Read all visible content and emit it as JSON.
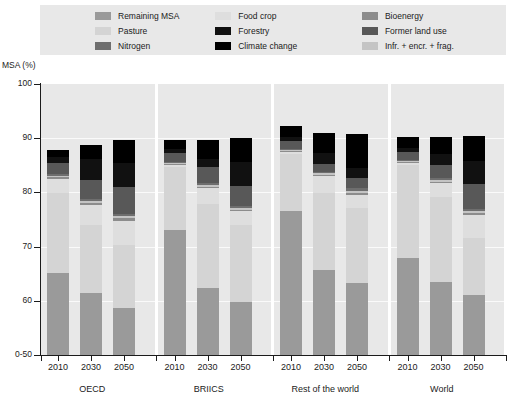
{
  "axis_title": "MSA (%)",
  "legend": {
    "columns": [
      [
        {
          "label": "Remaining MSA",
          "color": "#9a9a9a"
        },
        {
          "label": "Pasture",
          "color": "#d4d4d4"
        },
        {
          "label": "Nitrogen",
          "color": "#6e6e6e"
        }
      ],
      [
        {
          "label": "Food crop",
          "color": "#dedede"
        },
        {
          "label": "Forestry",
          "color": "#111111"
        },
        {
          "label": "Climate change",
          "color": "#000000"
        }
      ],
      [
        {
          "label": "Bioenergy",
          "color": "#8c8c8c"
        },
        {
          "label": "Former land use",
          "color": "#585858"
        },
        {
          "label": "Infr. + encr. + frag.",
          "color": "#c4c4c4"
        }
      ]
    ]
  },
  "chart_data": {
    "type": "bar",
    "subtype": "stacked",
    "title": "",
    "xlabel": "",
    "ylabel": "MSA (%)",
    "ylim": [
      50,
      100
    ],
    "ytick_labels": [
      "0-50",
      "60",
      "70",
      "80",
      "90",
      "100"
    ],
    "ytick_values": [
      50,
      60,
      70,
      80,
      90,
      100
    ],
    "grid": true,
    "legend_position": "top",
    "groups": [
      {
        "name": "OECD",
        "categories": [
          "2010",
          "2030",
          "2050"
        ]
      },
      {
        "name": "BRIICS",
        "categories": [
          "2010",
          "2030",
          "2050"
        ]
      },
      {
        "name": "Rest of the world",
        "categories": [
          "2010",
          "2030",
          "2050"
        ]
      },
      {
        "name": "World",
        "categories": [
          "2010",
          "2030",
          "2050"
        ]
      }
    ],
    "stack_order_bottom_to_top": [
      "Remaining MSA",
      "Pasture",
      "Food crop",
      "Bioenergy",
      "Infr. + encr. + frag.",
      "Nitrogen",
      "Former land use",
      "Forestry",
      "Climate change"
    ],
    "series_colors": {
      "Remaining MSA": "#9a9a9a",
      "Pasture": "#d4d4d4",
      "Food crop": "#dedede",
      "Bioenergy": "#8c8c8c",
      "Infr. + encr. + frag.": "#c4c4c4",
      "Nitrogen": "#6e6e6e",
      "Former land use": "#585858",
      "Forestry": "#111111",
      "Climate change": "#000000"
    },
    "bars": [
      {
        "group": "OECD",
        "year": "2010",
        "total_top": 87.8,
        "segments": [
          {
            "name": "Remaining MSA",
            "from": 50.0,
            "to": 65.2
          },
          {
            "name": "Pasture",
            "from": 65.2,
            "to": 79.8
          },
          {
            "name": "Food crop",
            "from": 79.8,
            "to": 82.5
          },
          {
            "name": "Bioenergy",
            "from": 82.5,
            "to": 82.8
          },
          {
            "name": "Infr. + encr. + frag.",
            "from": 82.8,
            "to": 83.0
          },
          {
            "name": "Nitrogen",
            "from": 83.0,
            "to": 83.3
          },
          {
            "name": "Former land use",
            "from": 83.3,
            "to": 85.5
          },
          {
            "name": "Forestry",
            "from": 85.5,
            "to": 86.6
          },
          {
            "name": "Climate change",
            "from": 86.6,
            "to": 87.8
          }
        ]
      },
      {
        "group": "OECD",
        "year": "2030",
        "total_top": 88.8,
        "segments": [
          {
            "name": "Remaining MSA",
            "from": 50.0,
            "to": 61.4
          },
          {
            "name": "Pasture",
            "from": 61.4,
            "to": 74.0
          },
          {
            "name": "Food crop",
            "from": 74.0,
            "to": 77.7
          },
          {
            "name": "Bioenergy",
            "from": 77.7,
            "to": 78.0
          },
          {
            "name": "Infr. + encr. + frag.",
            "from": 78.0,
            "to": 78.4
          },
          {
            "name": "Nitrogen",
            "from": 78.4,
            "to": 78.7
          },
          {
            "name": "Former land use",
            "from": 78.7,
            "to": 82.3
          },
          {
            "name": "Forestry",
            "from": 82.3,
            "to": 86.2
          },
          {
            "name": "Climate change",
            "from": 86.2,
            "to": 88.8
          }
        ]
      },
      {
        "group": "OECD",
        "year": "2050",
        "total_top": 89.6,
        "segments": [
          {
            "name": "Remaining MSA",
            "from": 50.0,
            "to": 58.7
          },
          {
            "name": "Pasture",
            "from": 58.7,
            "to": 70.3
          },
          {
            "name": "Food crop",
            "from": 70.3,
            "to": 74.8
          },
          {
            "name": "Bioenergy",
            "from": 74.8,
            "to": 75.2
          },
          {
            "name": "Infr. + encr. + frag.",
            "from": 75.2,
            "to": 75.6
          },
          {
            "name": "Nitrogen",
            "from": 75.6,
            "to": 76.0
          },
          {
            "name": "Former land use",
            "from": 76.0,
            "to": 81.0
          },
          {
            "name": "Forestry",
            "from": 81.0,
            "to": 85.5
          },
          {
            "name": "Climate change",
            "from": 85.5,
            "to": 89.6
          }
        ]
      },
      {
        "group": "BRIICS",
        "year": "2010",
        "total_top": 89.7,
        "segments": [
          {
            "name": "Remaining MSA",
            "from": 50.0,
            "to": 73.1
          },
          {
            "name": "Pasture",
            "from": 73.1,
            "to": 84.6
          },
          {
            "name": "Food crop",
            "from": 84.6,
            "to": 85.0
          },
          {
            "name": "Bioenergy",
            "from": 85.0,
            "to": 85.2
          },
          {
            "name": "Infr. + encr. + frag.",
            "from": 85.2,
            "to": 85.4
          },
          {
            "name": "Nitrogen",
            "from": 85.4,
            "to": 85.6
          },
          {
            "name": "Former land use",
            "from": 85.6,
            "to": 87.2
          },
          {
            "name": "Forestry",
            "from": 87.2,
            "to": 88.0
          },
          {
            "name": "Climate change",
            "from": 88.0,
            "to": 89.7
          }
        ]
      },
      {
        "group": "BRIICS",
        "year": "2030",
        "total_top": 89.6,
        "segments": [
          {
            "name": "Remaining MSA",
            "from": 50.0,
            "to": 62.3
          },
          {
            "name": "Pasture",
            "from": 62.3,
            "to": 77.8
          },
          {
            "name": "Food crop",
            "from": 77.8,
            "to": 80.8
          },
          {
            "name": "Bioenergy",
            "from": 80.8,
            "to": 81.0
          },
          {
            "name": "Infr. + encr. + frag.",
            "from": 81.0,
            "to": 81.4
          },
          {
            "name": "Nitrogen",
            "from": 81.4,
            "to": 81.7
          },
          {
            "name": "Former land use",
            "from": 81.7,
            "to": 84.6
          },
          {
            "name": "Forestry",
            "from": 84.6,
            "to": 86.2
          },
          {
            "name": "Climate change",
            "from": 86.2,
            "to": 89.6
          }
        ]
      },
      {
        "group": "BRIICS",
        "year": "2050",
        "total_top": 90.1,
        "segments": [
          {
            "name": "Remaining MSA",
            "from": 50.0,
            "to": 59.8
          },
          {
            "name": "Pasture",
            "from": 59.8,
            "to": 74.0
          },
          {
            "name": "Food crop",
            "from": 74.0,
            "to": 76.5
          },
          {
            "name": "Bioenergy",
            "from": 76.5,
            "to": 76.8
          },
          {
            "name": "Infr. + encr. + frag.",
            "from": 76.8,
            "to": 77.1
          },
          {
            "name": "Nitrogen",
            "from": 77.1,
            "to": 77.4
          },
          {
            "name": "Former land use",
            "from": 77.4,
            "to": 81.2
          },
          {
            "name": "Forestry",
            "from": 81.2,
            "to": 85.6
          },
          {
            "name": "Climate change",
            "from": 85.6,
            "to": 90.1
          }
        ]
      },
      {
        "group": "Rest of the world",
        "year": "2010",
        "total_top": 92.2,
        "segments": [
          {
            "name": "Remaining MSA",
            "from": 50.0,
            "to": 76.5
          },
          {
            "name": "Pasture",
            "from": 76.5,
            "to": 87.0
          },
          {
            "name": "Food crop",
            "from": 87.0,
            "to": 87.4
          },
          {
            "name": "Bioenergy",
            "from": 87.4,
            "to": 87.6
          },
          {
            "name": "Infr. + encr. + frag.",
            "from": 87.6,
            "to": 87.8
          },
          {
            "name": "Nitrogen",
            "from": 87.8,
            "to": 88.0
          },
          {
            "name": "Former land use",
            "from": 88.0,
            "to": 89.4
          },
          {
            "name": "Forestry",
            "from": 89.4,
            "to": 90.2
          },
          {
            "name": "Climate change",
            "from": 90.2,
            "to": 92.2
          }
        ]
      },
      {
        "group": "Rest of the world",
        "year": "2030",
        "total_top": 90.9,
        "segments": [
          {
            "name": "Remaining MSA",
            "from": 50.0,
            "to": 65.7
          },
          {
            "name": "Pasture",
            "from": 65.7,
            "to": 79.8
          },
          {
            "name": "Food crop",
            "from": 79.8,
            "to": 83.0
          },
          {
            "name": "Bioenergy",
            "from": 83.0,
            "to": 83.2
          },
          {
            "name": "Infr. + encr. + frag.",
            "from": 83.2,
            "to": 83.5
          },
          {
            "name": "Nitrogen",
            "from": 83.5,
            "to": 83.8
          },
          {
            "name": "Former land use",
            "from": 83.8,
            "to": 85.2
          },
          {
            "name": "Forestry",
            "from": 85.2,
            "to": 87.3
          },
          {
            "name": "Climate change",
            "from": 87.3,
            "to": 90.9
          }
        ]
      },
      {
        "group": "Rest of the world",
        "year": "2050",
        "total_top": 90.8,
        "segments": [
          {
            "name": "Remaining MSA",
            "from": 50.0,
            "to": 63.3
          },
          {
            "name": "Pasture",
            "from": 63.3,
            "to": 77.2
          },
          {
            "name": "Food crop",
            "from": 77.2,
            "to": 79.6
          },
          {
            "name": "Bioenergy",
            "from": 79.6,
            "to": 79.9
          },
          {
            "name": "Infr. + encr. + frag.",
            "from": 79.9,
            "to": 80.2
          },
          {
            "name": "Nitrogen",
            "from": 80.2,
            "to": 80.9
          },
          {
            "name": "Former land use",
            "from": 80.9,
            "to": 82.6
          },
          {
            "name": "Forestry",
            "from": 82.6,
            "to": 84.5
          },
          {
            "name": "Climate change",
            "from": 84.5,
            "to": 90.8
          }
        ]
      },
      {
        "group": "World",
        "year": "2010",
        "total_top": 90.3,
        "segments": [
          {
            "name": "Remaining MSA",
            "from": 50.0,
            "to": 67.8
          },
          {
            "name": "Pasture",
            "from": 67.8,
            "to": 85.0
          },
          {
            "name": "Food crop",
            "from": 85.0,
            "to": 85.4
          },
          {
            "name": "Bioenergy",
            "from": 85.4,
            "to": 85.6
          },
          {
            "name": "Infr. + encr. + frag.",
            "from": 85.6,
            "to": 85.8
          },
          {
            "name": "Nitrogen",
            "from": 85.8,
            "to": 86.0
          },
          {
            "name": "Former land use",
            "from": 86.0,
            "to": 87.5
          },
          {
            "name": "Forestry",
            "from": 87.5,
            "to": 88.2
          },
          {
            "name": "Climate change",
            "from": 88.2,
            "to": 90.3
          }
        ]
      },
      {
        "group": "World",
        "year": "2030",
        "total_top": 90.3,
        "segments": [
          {
            "name": "Remaining MSA",
            "from": 50.0,
            "to": 63.5
          },
          {
            "name": "Pasture",
            "from": 63.5,
            "to": 79.2
          },
          {
            "name": "Food crop",
            "from": 79.2,
            "to": 81.8
          },
          {
            "name": "Bioenergy",
            "from": 81.8,
            "to": 82.0
          },
          {
            "name": "Infr. + encr. + frag.",
            "from": 82.0,
            "to": 82.3
          },
          {
            "name": "Nitrogen",
            "from": 82.3,
            "to": 82.6
          },
          {
            "name": "Former land use",
            "from": 82.6,
            "to": 85.1
          },
          {
            "name": "Forestry",
            "from": 85.1,
            "to": 87.1
          },
          {
            "name": "Climate change",
            "from": 87.1,
            "to": 90.3
          }
        ]
      },
      {
        "group": "World",
        "year": "2050",
        "total_top": 90.4,
        "segments": [
          {
            "name": "Remaining MSA",
            "from": 50.0,
            "to": 61.0
          },
          {
            "name": "Pasture",
            "from": 61.0,
            "to": 71.5
          },
          {
            "name": "Food crop",
            "from": 71.5,
            "to": 75.9
          },
          {
            "name": "Bioenergy",
            "from": 75.9,
            "to": 76.2
          },
          {
            "name": "Infr. + encr. + frag.",
            "from": 76.2,
            "to": 76.5
          },
          {
            "name": "Nitrogen",
            "from": 76.5,
            "to": 77.0
          },
          {
            "name": "Former land use",
            "from": 77.0,
            "to": 81.6
          },
          {
            "name": "Forestry",
            "from": 81.6,
            "to": 85.8
          },
          {
            "name": "Climate change",
            "from": 85.8,
            "to": 90.4
          }
        ]
      }
    ]
  }
}
